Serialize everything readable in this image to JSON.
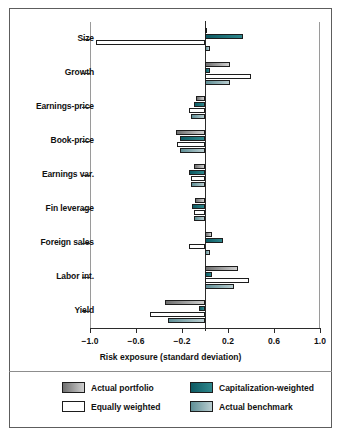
{
  "chart_data": {
    "type": "bar",
    "orientation": "horizontal",
    "title": "",
    "xlabel": "Risk exposure (standard deviation)",
    "ylabel": "",
    "xlim": [
      -1.0,
      1.0
    ],
    "xticks": [
      -1.0,
      -0.6,
      -0.2,
      0.2,
      0.6,
      1.0
    ],
    "xticklabels": [
      "−1.0",
      "−0.6",
      "−0.2",
      "0.2",
      "0.6",
      "1.0"
    ],
    "grid": false,
    "zero_line": true,
    "legend_position": "bottom",
    "categories": [
      "Size",
      "Growth",
      "Earnings-price",
      "Book-price",
      "Earnings var.",
      "Fin leverage",
      "Foreign sales",
      "Labor int.",
      "Yield"
    ],
    "series": [
      {
        "name": "Actual portfolio",
        "color": "#9a9a9a",
        "values": [
          0.02,
          0.22,
          -0.08,
          -0.25,
          -0.1,
          -0.09,
          0.06,
          0.29,
          -0.35
        ]
      },
      {
        "name": "Capitalization-weighted",
        "color": "#1a6b72",
        "values": [
          0.33,
          0.04,
          -0.1,
          -0.22,
          -0.14,
          -0.11,
          0.16,
          0.06,
          -0.05
        ]
      },
      {
        "name": "Equally weighted",
        "color": "#ffffff",
        "values": [
          -0.95,
          0.4,
          -0.14,
          -0.24,
          -0.12,
          -0.1,
          -0.14,
          0.38,
          -0.48
        ]
      },
      {
        "name": "Actual benchmark",
        "color": "#8fb0b5",
        "values": [
          0.04,
          0.22,
          -0.12,
          -0.22,
          -0.12,
          -0.1,
          0.04,
          0.25,
          -0.32
        ]
      }
    ]
  },
  "legend": {
    "entries": [
      {
        "label": "Actual portfolio",
        "swatch": "gray-gradient"
      },
      {
        "label": "Capitalization-weighted",
        "swatch": "dark-teal-gradient"
      },
      {
        "label": "Equally weighted",
        "swatch": "white"
      },
      {
        "label": "Actual benchmark",
        "swatch": "light-teal-gradient"
      }
    ]
  }
}
